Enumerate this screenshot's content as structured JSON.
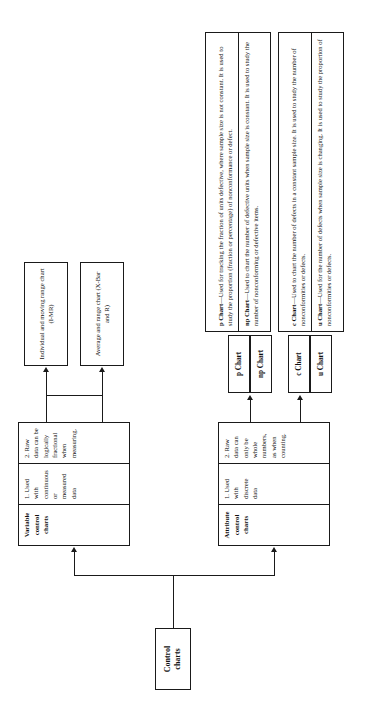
{
  "diagram": {
    "title_node": {
      "label": "Control\ncharts"
    },
    "branches": [
      {
        "name": "variable",
        "header": "Variable control charts",
        "bullets": [
          "1. Used with continuous or measured data",
          "2. Raw data can be logically fractional when measuring."
        ],
        "charts": [
          {
            "label": "Individual and moving range chart (I-MR)"
          },
          {
            "label": "Average and range chart (X-Bar and R)"
          }
        ]
      },
      {
        "name": "attribute",
        "header": "Attribute control charts",
        "bullets": [
          "1. Used with discrete data",
          "2. Raw data can only be whole numbers, as when counting."
        ],
        "charts": [
          {
            "label": "p Chart"
          },
          {
            "label": "np Chart"
          },
          {
            "label": "c Chart"
          },
          {
            "label": "u Chart"
          }
        ]
      }
    ],
    "descriptions": [
      {
        "chip": "p Chart",
        "lead": "p Chart",
        "text": "—Used for tracking the fraction of units defective, where sample size is not constant. It is used to study the proportion (fraction or percentage) of nonconformance or defect."
      },
      {
        "chip": "np Chart",
        "lead": "np Chart",
        "text": "—Used to chart the number of defective units when sample size is constant. It is used to study the number of nonconforming or defective items."
      },
      {
        "chip": "c Chart",
        "lead": "c Chart",
        "text": "—Used to chart the number of defects in a constant sample size. It is used to study the number of nonconformities or defects."
      },
      {
        "chip": "u Chart",
        "lead": "u Chart",
        "text": "—Used for the number of defects when sample size is changing. It is used to study the proportion of nonconformities or defects."
      }
    ],
    "colors": {
      "line": "#1a1a1a",
      "background": "#ffffff",
      "text": "#111111"
    }
  }
}
